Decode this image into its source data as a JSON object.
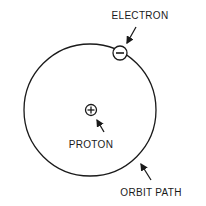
{
  "diagram": {
    "colors": {
      "stroke": "#1a1a1a",
      "background": "#ffffff"
    },
    "orbit": {
      "label": "ORBIT PATH",
      "cx": 90,
      "cy": 110,
      "r": 66
    },
    "proton": {
      "label": "PROTON",
      "symbol": "+",
      "cx": 91,
      "cy": 110,
      "r": 5.5
    },
    "electron": {
      "label": "ELECTRON",
      "symbol": "−",
      "cx": 120,
      "cy": 53,
      "r": 7
    }
  }
}
